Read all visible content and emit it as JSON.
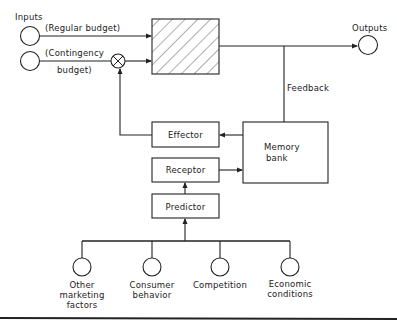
{
  "labels": {
    "inputs": "Inputs",
    "regular_budget": "(Regular budget)",
    "contingency_line1": "(Contingency",
    "contingency_line2": "budget)",
    "outputs": "Outputs",
    "feedback": "Feedback"
  },
  "blocks": {
    "effector": "Effector",
    "receptor": "Receptor",
    "predictor": "Predictor",
    "memory_line1": "Memory",
    "memory_line2": "bank"
  },
  "factors": [
    {
      "line1": "Other",
      "line2": "marketing",
      "line3": "factors"
    },
    {
      "line1": "Consumer",
      "line2": "behavior",
      "line3": ""
    },
    {
      "line1": "Competition",
      "line2": "",
      "line3": ""
    },
    {
      "line1": "Economic",
      "line2": "conditions",
      "line3": ""
    }
  ],
  "colors": {
    "line": "#222222",
    "background": "#ffffff"
  }
}
